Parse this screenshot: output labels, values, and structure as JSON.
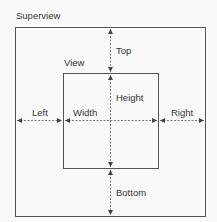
{
  "labels": {
    "superview": "Superview",
    "view": "View",
    "top": "Top",
    "height": "Height",
    "left": "Left",
    "width": "Width",
    "right": "Right",
    "bottom": "Bottom"
  },
  "colors": {
    "background": "#fafafa",
    "stroke": "#555555",
    "text": "#333333"
  },
  "geometry": {
    "superview_rect": {
      "x": 15,
      "y": 27,
      "w": 190,
      "h": 189
    },
    "view_rect": {
      "x": 63,
      "y": 73,
      "w": 95,
      "h": 95
    },
    "center_x": 110,
    "center_y": 120
  }
}
